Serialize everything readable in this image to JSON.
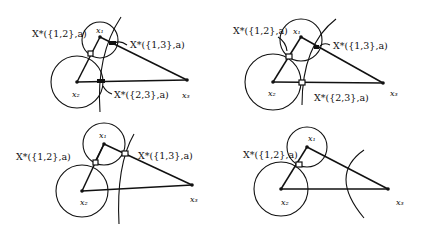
{
  "panels": [
    {
      "id": "top-left",
      "labels": {
        "x1": "x₁",
        "x2": "x₂",
        "x3": "x₃",
        "a": "X*({1,2},a)",
        "b": "X*({1,3},a)",
        "c": "X*({2,3},a)"
      }
    },
    {
      "id": "top-right",
      "labels": {
        "x1": "x₁",
        "x2": "x₂",
        "x3": "x₃",
        "a": "X*({1,2},a)",
        "b": "X*({1,3},a)",
        "c": "X*({2,3},a)"
      }
    },
    {
      "id": "bottom-left",
      "labels": {
        "x1": "x₁",
        "x2": "x₂",
        "x3": "x₃",
        "a": "X*({1,2},a)",
        "b": "X*({1,3},a)"
      }
    },
    {
      "id": "bottom-right",
      "labels": {
        "x1": "x₁",
        "x2": "x₂",
        "x3": "x₃",
        "a": "X*({1,2},a)"
      }
    }
  ]
}
